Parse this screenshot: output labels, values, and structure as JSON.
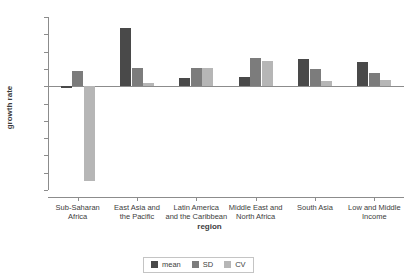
{
  "title_fragment": "",
  "chart_data": {
    "type": "bar",
    "title": "",
    "xlabel": "region",
    "ylabel": "growth rate",
    "ylim": [
      -12,
      8
    ],
    "yticks": [
      8,
      6,
      4,
      2,
      0,
      -2,
      -4,
      -6,
      -8,
      -10,
      -12
    ],
    "ytick_labels": [
      "8",
      "6",
      "4",
      "2",
      "0",
      "-2",
      "-4",
      "-6",
      "-8",
      "-10",
      "-12"
    ],
    "grid": false,
    "legend_position": "bottom-center",
    "categories": [
      "Sub-Saharan\nAfrica",
      "East Asia and\nthe Pacific",
      "Latin America\nand the Caribbean",
      "Middle East and\nNorth Africa",
      "South Asia",
      "Low and Middle\nIncome"
    ],
    "category_lines": [
      [
        "Sub-Saharan",
        "Africa"
      ],
      [
        "East Asia and",
        "the Pacific"
      ],
      [
        "Latin America",
        "and the Caribbean"
      ],
      [
        "Middle East and",
        "North Africa"
      ],
      [
        "South Asia",
        ""
      ],
      [
        "Low and Middle",
        "Income"
      ]
    ],
    "series": [
      {
        "name": "mean",
        "color": "#494949",
        "values": [
          -0.2,
          6.7,
          1.0,
          1.1,
          3.1,
          2.8
        ]
      },
      {
        "name": "SD",
        "color": "#7c7c7c",
        "values": [
          1.7,
          2.1,
          2.1,
          3.3,
          2.0,
          1.5
        ]
      },
      {
        "name": "CV",
        "color": "#b6b6b6",
        "values": [
          -11.0,
          0.4,
          2.1,
          2.9,
          0.6,
          0.7
        ]
      }
    ]
  },
  "legend": {
    "items": [
      {
        "label": "mean",
        "color": "#494949"
      },
      {
        "label": "SD",
        "color": "#7c7c7c"
      },
      {
        "label": "CV",
        "color": "#b6b6b6"
      }
    ]
  },
  "colors": {
    "mean": "#494949",
    "sd": "#7c7c7c",
    "cv": "#b6b6b6",
    "axis": "#8c8c8c",
    "text": "#3c3c3c",
    "background": "#ffffff"
  }
}
